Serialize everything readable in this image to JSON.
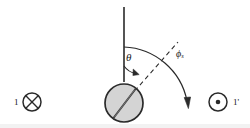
{
  "figure": {
    "background_color": "#ffffff",
    "stroke_color": "#2a2a2a",
    "sphere_fill": "#d4d4d4",
    "labels": {
      "theta": "θ",
      "phi_base": "ϕ",
      "phi_subscript": "s",
      "left_wire": "1",
      "right_wire": "1'"
    },
    "icons": {
      "into_page": "⊗",
      "out_of_page": "⊙"
    },
    "elements": {
      "vertical_axis": "vertical reference line",
      "dipole_needle": "tilted needle through sphere",
      "theta_arc": "angle arc from vertical to dipole axis",
      "phi_arc": "large arc with downward arrowhead",
      "dashed_ray": "dashed ray along dipole axis"
    }
  },
  "geometry": {
    "sphere_center_x": 124,
    "sphere_center_y": 103,
    "sphere_radius": 19,
    "vertical_axis_top_y": 7,
    "vertical_axis_bottom_y": 82,
    "theta_degrees": 42,
    "phi_arc_label_position": "upper-right"
  }
}
